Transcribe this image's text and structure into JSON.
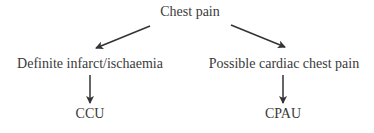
{
  "diagram": {
    "nodes": [
      {
        "id": "root",
        "label": "Chest pain"
      },
      {
        "id": "left",
        "label": "Definite infarct/ischaemia"
      },
      {
        "id": "right",
        "label": "Possible cardiac chest pain"
      },
      {
        "id": "left_leaf",
        "label": "CCU"
      },
      {
        "id": "right_leaf",
        "label": "CPAU"
      }
    ],
    "edges": [
      {
        "from": "root",
        "to": "left"
      },
      {
        "from": "root",
        "to": "right"
      },
      {
        "from": "left",
        "to": "left_leaf"
      },
      {
        "from": "right",
        "to": "right_leaf"
      }
    ],
    "colors": {
      "text": "#3a3a3a",
      "arrow": "#333333",
      "background": "#ffffff"
    }
  }
}
